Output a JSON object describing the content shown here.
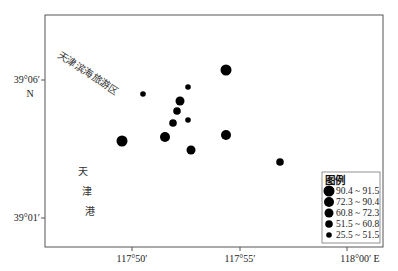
{
  "map": {
    "frame": {
      "x": 45,
      "y": 15,
      "w": 338,
      "h": 232
    },
    "x_axis": {
      "ticks": [
        {
          "label": "117°50′",
          "x": 132
        },
        {
          "label": "117°55′",
          "x": 240
        },
        {
          "label": "118°00′ E",
          "x": 347
        }
      ]
    },
    "y_axis": {
      "ticks": [
        {
          "label": "39°06′",
          "sublabel": "N",
          "y": 80
        },
        {
          "label": "39°01′",
          "y": 218
        }
      ]
    },
    "place_labels": {
      "tourism_zone": "天津滨海旅游区",
      "port_chars": [
        "天",
        "津",
        "港"
      ]
    },
    "points": [
      {
        "x": 226,
        "y": 70,
        "class": 1
      },
      {
        "x": 188,
        "y": 87,
        "class": 5
      },
      {
        "x": 143,
        "y": 94,
        "class": 5
      },
      {
        "x": 180,
        "y": 101,
        "class": 3
      },
      {
        "x": 177,
        "y": 111,
        "class": 4
      },
      {
        "x": 173,
        "y": 123,
        "class": 4
      },
      {
        "x": 188,
        "y": 120,
        "class": 5
      },
      {
        "x": 165,
        "y": 137,
        "class": 2
      },
      {
        "x": 226,
        "y": 135,
        "class": 2
      },
      {
        "x": 122,
        "y": 141,
        "class": 1
      },
      {
        "x": 191,
        "y": 150,
        "class": 3
      },
      {
        "x": 280,
        "y": 162,
        "class": 4
      }
    ],
    "colors": {
      "point": "#000000",
      "frame": "#555555"
    }
  },
  "legend": {
    "title": "图例",
    "items": [
      {
        "label": "90.4 ~ 91.5",
        "r": 5.5
      },
      {
        "label": "72.3 ~ 90.4",
        "r": 5
      },
      {
        "label": "60.8 ~ 72.3",
        "r": 4.5
      },
      {
        "label": "51.5 ~ 60.8",
        "r": 3.8
      },
      {
        "label": "25.5 ~ 51.5",
        "r": 2.8
      }
    ]
  }
}
